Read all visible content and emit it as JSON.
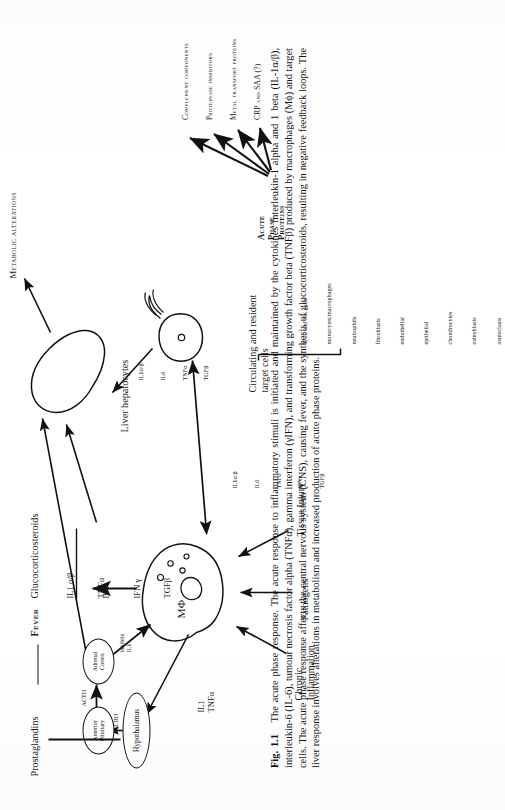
{
  "figure": {
    "number": "Fig. 1.1",
    "title": "The acute phase response.",
    "caption_body": "The acute response to inflammatory stimuli is initiated and maintained by the cytokines interleukin-1 alpha and 1 beta (IL-1α/β), interleukin-6 (IL-6), tumour necrosis factor alpha (TNFα), gamma interferon (γIFN), and transforming growth factor beta (TNFβ) produced by macrophages (Mϕ) and target cells. The acute phase response affects the central nervous system (CNS), causing fever, and the synthesis of glucocorticosteroids, resulting in negative feedback loops. The liver response involves alterations in metabolism and increased production of acute phase proteins."
  },
  "diagram": {
    "stimuli": [
      {
        "id": "chronic-inflammation",
        "label": "Chronic\nInflammation"
      },
      {
        "id": "pathogens",
        "label": "Pathogens"
      },
      {
        "id": "tissue-injury",
        "label": "Tissue Injury"
      }
    ],
    "nodes": {
      "macrophage": "MΦ",
      "hypothalamus": "Hypothalamus",
      "anterior_pituitary": "Anterior\nPituitary",
      "adrenal_cortex": "Adrenal\nCortex",
      "liver": "Liver hepatocytes",
      "target_cell": "target-cell"
    },
    "edge_labels": {
      "crh": "CRH",
      "acth": "ACTH",
      "glucocorticosteroids": "Glucocorticosteroids",
      "inhibits_il1": "inhibits\nIL1",
      "il1_tnfa_left": "IL1\nTNFα"
    },
    "cytokines": {
      "macrophage_up": [
        "IL1 α/β",
        "TNFα",
        "IL6",
        "IFN γ",
        "TGFβ"
      ],
      "macrophage_up_group1": [
        "IL1 α/β",
        "TNFα"
      ],
      "macrophage_up_group2": [
        "IL6",
        "IFN γ",
        "TGFβ"
      ],
      "macrophage_to_target": [
        "IL1α/β",
        "IL6",
        "TNFα",
        "IFNγ",
        "TGFβ"
      ],
      "target_to_liver": [
        "IL1α/β",
        "IL6",
        "TNFα",
        "TGFβ"
      ],
      "target_right": [
        "IL1α/β",
        "IL6",
        "TNFα",
        "TGFβ"
      ]
    },
    "target_cells": {
      "heading": "Circulating and resident\ntarget cells",
      "list": [
        "T, B, and NK cells",
        "monocytes/macrophages",
        "neutrophils",
        "fibroblasts",
        "endothelial",
        "epithelial",
        "chondrocytes",
        "osteoblasts",
        "osteoclasts"
      ]
    },
    "outputs": {
      "prostaglandins": "Prostaglandins",
      "fever": "Fever",
      "metabolic_alterations": "Metabolic alterations",
      "acute_phase_proteins": "Acute\nPhase\nProteins",
      "acute_phase_protein_list": [
        "Complement components",
        "Proteinase inhibitors",
        "Metal transport proteins",
        "CRP and SAA (?)"
      ]
    }
  },
  "colors": {
    "ink": "#111111",
    "paper": "#ffffff"
  }
}
